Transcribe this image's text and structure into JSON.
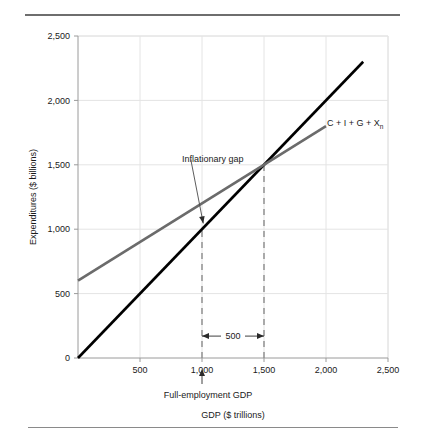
{
  "figure": {
    "has_top_rule": true,
    "has_bottom_rule": true,
    "background": "#ffffff"
  },
  "chart_data": {
    "type": "line",
    "title": "",
    "xlabel": "GDP ($ trillions)",
    "ylabel": "Expenditures ($ billions)",
    "xlim": [
      0,
      2500
    ],
    "ylim": [
      0,
      2500
    ],
    "xticks": [
      0,
      500,
      1000,
      1500,
      2000,
      2500
    ],
    "xtick_labels": [
      "",
      "500",
      "1,000",
      "1,500",
      "2,000",
      "2,500"
    ],
    "yticks": [
      0,
      500,
      1000,
      1500,
      2000,
      2500
    ],
    "ytick_labels": [
      "0",
      "500",
      "1,000",
      "1,500",
      "2,000",
      "2,500"
    ],
    "grid": true,
    "grid_color": "#e4e4e4",
    "legend_position": "inline-right",
    "series": [
      {
        "name": "45-degree line",
        "label": "",
        "color": "#000000",
        "width": 2.6,
        "x": [
          0,
          2300
        ],
        "y": [
          0,
          2300
        ]
      },
      {
        "name": "C + I + G + Xn",
        "label": "C + I + G + X",
        "label_subscript": "n",
        "color": "#6b6b6b",
        "width": 2.6,
        "x": [
          0,
          2000
        ],
        "y": [
          600,
          1800
        ]
      }
    ],
    "annotations": [
      {
        "name": "inflationary-gap",
        "text": "Inflationary gap",
        "text_x": 840,
        "text_y": 1610,
        "arrow_from_x": 910,
        "arrow_from_y": 1540,
        "arrow_to_x": 1010,
        "arrow_to_y": 1045
      },
      {
        "name": "gap-measure",
        "text": "500",
        "from_x": 1000,
        "to_x": 1500,
        "y": 170
      },
      {
        "name": "full-employment-gdp",
        "text": "Full-employment GDP",
        "x": 1000
      }
    ],
    "reference_lines": [
      {
        "name": "full-employment-gdp-line",
        "x": 1000,
        "y_from": 0,
        "y_to": 1000,
        "style": "dashed",
        "color": "#8c8c8c"
      },
      {
        "name": "equilibrium-gdp-line",
        "x": 1500,
        "y_from": 0,
        "y_to": 1500,
        "style": "dashed",
        "color": "#8c8c8c"
      }
    ],
    "key_points": [
      {
        "name": "equilibrium",
        "x": 1500,
        "y": 1500
      },
      {
        "name": "full-employment",
        "x": 1000,
        "y": 1000
      }
    ]
  }
}
